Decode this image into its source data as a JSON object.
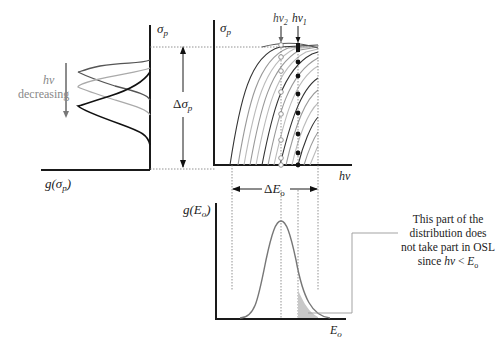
{
  "left_panel": {
    "y_axis_label": "σp",
    "x_axis_label": "g(σp)",
    "annotation_line1": "hv",
    "annotation_line2": "decreasing",
    "curves": [
      "dark",
      "light-gray",
      "black"
    ]
  },
  "top_right_panel": {
    "y_axis_label": "σp",
    "x_axis_label": "hv",
    "marker_labels": [
      "hv2",
      "hv1"
    ],
    "delta_sigma_label": "Δσp",
    "curve_count": 16
  },
  "bottom_panel": {
    "y_axis_label": "g(Eo)",
    "x_axis_label": "Eo",
    "delta_E_label": "ΔEo"
  },
  "callout": {
    "line1": "This part of the",
    "line2": "distribution does",
    "line3": "not take part in OSL",
    "line4": "since hv < Eo"
  },
  "colors": {
    "dark_curve": "#333333",
    "gray_curve": "#999999",
    "light_curve": "#bbbbbb",
    "shade": "#c8c8c8"
  }
}
